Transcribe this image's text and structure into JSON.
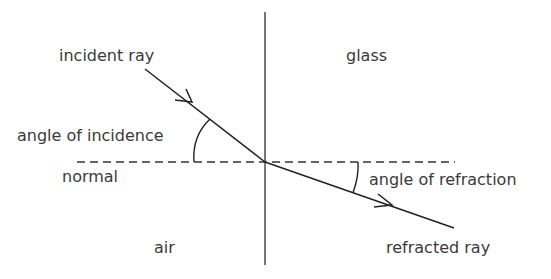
{
  "diagram": {
    "type": "refraction",
    "labels": {
      "incident_ray": "incident ray",
      "glass": "glass",
      "angle_of_incidence": "angle of incidence",
      "normal": "normal",
      "angle_of_refraction": "angle of refraction",
      "air": "air",
      "refracted_ray": "refracted ray"
    },
    "colors": {
      "line": "#2a2a2a",
      "boundary": "#555555",
      "text": "#3a3a3a"
    }
  }
}
